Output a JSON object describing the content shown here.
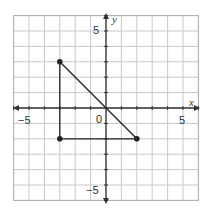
{
  "chart_data": {
    "type": "scatter",
    "title": "",
    "xlabel": "x",
    "ylabel": "y",
    "xlim": [
      -6,
      6
    ],
    "ylim": [
      -6,
      6
    ],
    "grid": true,
    "x_tick_labels": [
      "-5",
      "0",
      "5"
    ],
    "y_tick_labels": [
      "5",
      "-5"
    ],
    "origin_label": "0",
    "points": [
      {
        "x": -3,
        "y": 3
      },
      {
        "x": -3,
        "y": -2
      },
      {
        "x": 2,
        "y": -2
      }
    ],
    "segments": [
      {
        "from": [
          -3,
          3
        ],
        "to": [
          -3,
          -2
        ]
      },
      {
        "from": [
          -3,
          -2
        ],
        "to": [
          2,
          -2
        ]
      },
      {
        "from": [
          -3,
          3
        ],
        "to": [
          2,
          -2
        ]
      }
    ],
    "shape": "right triangle"
  },
  "labels": {
    "x_axis": "x",
    "y_axis": "y",
    "origin": "0",
    "x_neg5": "−5",
    "x_pos5": "5",
    "y_pos5": "5",
    "y_neg5": "−5"
  },
  "colors": {
    "grid": "#c8c8c8",
    "axis": "#333333",
    "shape": "#222222",
    "border": "#b0b0b0"
  }
}
